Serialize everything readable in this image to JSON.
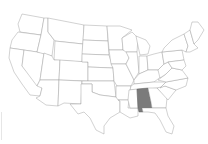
{
  "map": {
    "title": "United States",
    "highlighted_state": "Alabama",
    "colors": {
      "background": "#ffffff",
      "state_fill": "#ffffff",
      "state_border": "#9a9a9a",
      "highlight_fill": "#7b7b7b"
    },
    "states": [
      "Washington",
      "Oregon",
      "California",
      "Nevada",
      "Idaho",
      "Montana",
      "Wyoming",
      "Utah",
      "Arizona",
      "Colorado",
      "New Mexico",
      "North Dakota",
      "South Dakota",
      "Nebraska",
      "Kansas",
      "Oklahoma",
      "Texas",
      "Minnesota",
      "Iowa",
      "Missouri",
      "Arkansas",
      "Louisiana",
      "Wisconsin",
      "Illinois",
      "Michigan",
      "Indiana",
      "Ohio",
      "Kentucky",
      "Tennessee",
      "Mississippi",
      "Alabama",
      "Georgia",
      "Florida",
      "South Carolina",
      "North Carolina",
      "Virginia",
      "West Virginia",
      "Pennsylvania",
      "New York",
      "Maine",
      "New England",
      "Mid-Atlantic"
    ]
  }
}
